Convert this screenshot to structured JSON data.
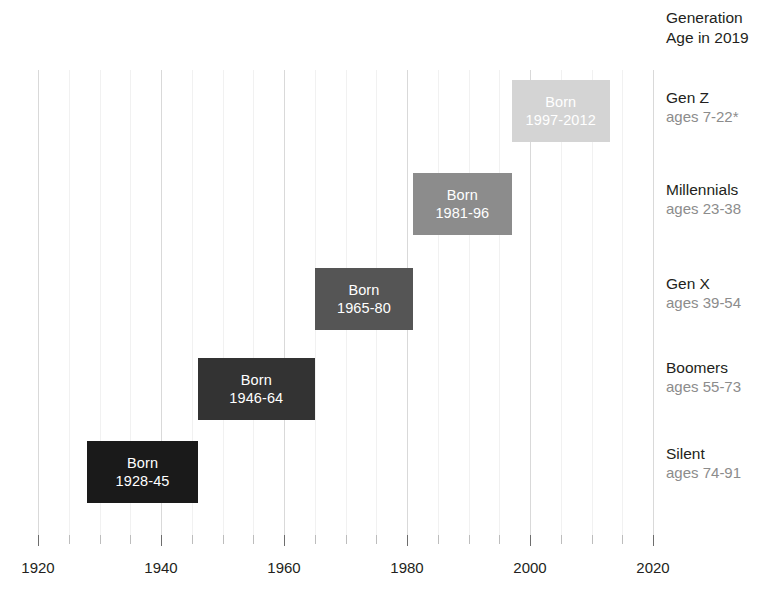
{
  "header": {
    "line1": "Generation",
    "line2": "Age in 2019"
  },
  "chart_data": {
    "type": "bar",
    "orientation": "horizontal-timeline",
    "title": "",
    "xlabel": "",
    "ylabel": "",
    "xlim": [
      1918,
      2018
    ],
    "grid": true,
    "grid_interval": 5,
    "major_grid_interval": 20,
    "legend_position": "right",
    "tick_labels": [
      "1920",
      "1940",
      "1960",
      "1980",
      "2000",
      "2020"
    ],
    "tick_values": [
      1920,
      1940,
      1960,
      1980,
      2000,
      2020
    ],
    "minor_tick_values": [
      1920,
      1925,
      1930,
      1935,
      1940,
      1945,
      1950,
      1955,
      1960,
      1965,
      1970,
      1975,
      1980,
      1985,
      1990,
      1995,
      2000,
      2005,
      2010,
      2015,
      2020
    ],
    "series": [
      {
        "name": "Gen Z",
        "ages": "ages 7-22*",
        "bar_line1": "Born",
        "bar_line2": "1997-2012",
        "start": 1997,
        "end": 2012,
        "color": "#d4d4d4",
        "text_color": "#ffffff",
        "row": 0
      },
      {
        "name": "Millennials",
        "ages": "ages 23-38",
        "bar_line1": "Born",
        "bar_line2": "1981-96",
        "start": 1981,
        "end": 1996,
        "color": "#8c8c8c",
        "text_color": "#ffffff",
        "row": 1
      },
      {
        "name": "Gen X",
        "ages": "ages 39-54",
        "bar_line1": "Born",
        "bar_line2": "1965-80",
        "start": 1965,
        "end": 1980,
        "color": "#555555",
        "text_color": "#ffffff",
        "row": 2
      },
      {
        "name": "Boomers",
        "ages": "ages 55-73",
        "bar_line1": "Born",
        "bar_line2": "1946-64",
        "start": 1946,
        "end": 1964,
        "color": "#333333",
        "text_color": "#ffffff",
        "row": 3
      },
      {
        "name": "Silent",
        "ages": "ages 74-91",
        "bar_line1": "Born",
        "bar_line2": "1928-45",
        "start": 1928,
        "end": 1945,
        "color": "#1a1a1a",
        "text_color": "#ffffff",
        "row": 4
      }
    ]
  }
}
